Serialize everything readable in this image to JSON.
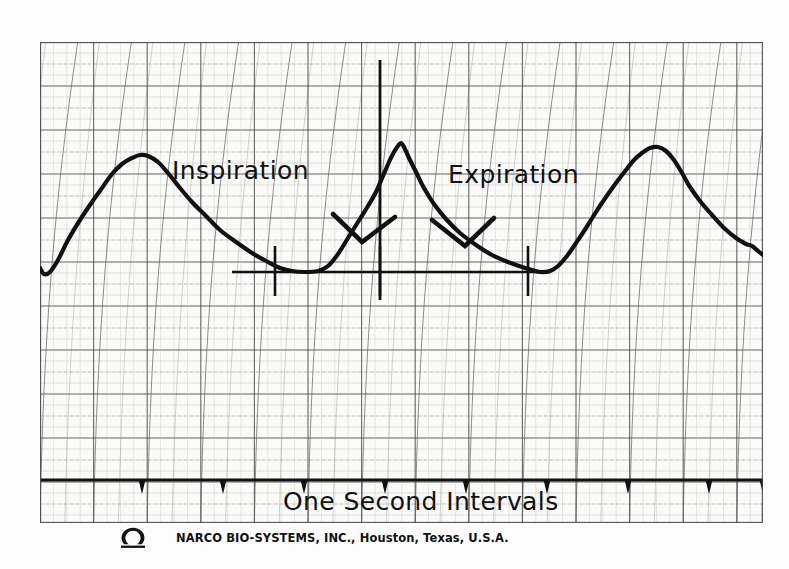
{
  "document": {
    "kind": "chart-recorder-strip",
    "manufacturer_line": "NARCO BIO-SYSTEMS, INC., Houston, Texas, U.S.A.",
    "logo_icon": "omega-logo-icon"
  },
  "annotations": {
    "inspiration_label": "Inspiration",
    "expiration_label": "Expiration",
    "timebase_label": "One Second Intervals"
  },
  "colors": {
    "paper": "#fbfbf9",
    "grid_minor": "#b9b9b9",
    "grid_major": "#4a4a4a",
    "grid_dotted": "#9a9a9a",
    "curved_rulings": "#5a5a5a",
    "trace": "#111111",
    "ink": "#111111",
    "background": "#fdfdfd"
  },
  "chart_data": {
    "type": "line",
    "subtitle": "NARCO BIO-SYSTEMS chart-recorder strip",
    "xlabel": "One Second Intervals",
    "ylabel": "",
    "grid": true,
    "legend": "none",
    "axis_units": {
      "x": "seconds",
      "y": "relative respiratory excursion"
    },
    "xlim": [
      0,
      723
    ],
    "ylim": [
      0,
      481
    ],
    "note": "Coordinates are in paper pixels: x left-to-right = time, y is inverted (smaller y = greater inspiration).",
    "timing_marks_count": 9,
    "timing_mark_x": [
      102,
      183,
      264,
      345,
      426,
      507,
      588,
      669,
      723
    ],
    "timing_baseline_y": 438,
    "measurement_line": {
      "x_start": 192,
      "x_end": 510,
      "y": 230
    },
    "measurement_ticks_x": [
      235,
      340,
      488
    ],
    "series": [
      {
        "name": "Respiratory trace",
        "points": [
          [
            0,
            226
          ],
          [
            4,
            232
          ],
          [
            10,
            230
          ],
          [
            18,
            218
          ],
          [
            28,
            198
          ],
          [
            40,
            178
          ],
          [
            52,
            160
          ],
          [
            62,
            146
          ],
          [
            72,
            132
          ],
          [
            82,
            122
          ],
          [
            92,
            116
          ],
          [
            100,
            113
          ],
          [
            108,
            114
          ],
          [
            118,
            120
          ],
          [
            128,
            131
          ],
          [
            140,
            146
          ],
          [
            152,
            160
          ],
          [
            166,
            174
          ],
          [
            180,
            188
          ],
          [
            196,
            200
          ],
          [
            212,
            211
          ],
          [
            228,
            220
          ],
          [
            240,
            226
          ],
          [
            252,
            229
          ],
          [
            264,
            230
          ],
          [
            278,
            229
          ],
          [
            288,
            224
          ],
          [
            298,
            212
          ],
          [
            308,
            196
          ],
          [
            318,
            180
          ],
          [
            328,
            164
          ],
          [
            336,
            150
          ],
          [
            343,
            134
          ],
          [
            349,
            120
          ],
          [
            354,
            110
          ],
          [
            358,
            104
          ],
          [
            361,
            101
          ],
          [
            364,
            105
          ],
          [
            369,
            116
          ],
          [
            376,
            130
          ],
          [
            384,
            146
          ],
          [
            394,
            162
          ],
          [
            406,
            177
          ],
          [
            420,
            191
          ],
          [
            436,
            203
          ],
          [
            452,
            213
          ],
          [
            468,
            220
          ],
          [
            482,
            225
          ],
          [
            492,
            228
          ],
          [
            500,
            230
          ],
          [
            510,
            229
          ],
          [
            518,
            224
          ],
          [
            527,
            214
          ],
          [
            536,
            201
          ],
          [
            546,
            186
          ],
          [
            556,
            170
          ],
          [
            566,
            155
          ],
          [
            576,
            141
          ],
          [
            586,
            128
          ],
          [
            594,
            118
          ],
          [
            602,
            111
          ],
          [
            610,
            106
          ],
          [
            618,
            105
          ],
          [
            626,
            109
          ],
          [
            634,
            118
          ],
          [
            642,
            131
          ],
          [
            650,
            145
          ],
          [
            660,
            159
          ],
          [
            672,
            173
          ],
          [
            684,
            186
          ],
          [
            696,
            196
          ],
          [
            706,
            202
          ],
          [
            712,
            204
          ],
          [
            718,
            209
          ],
          [
            723,
            213
          ]
        ]
      }
    ],
    "features": [
      {
        "name": "peak-1",
        "type": "inspiratory peak",
        "x": 100,
        "y": 113
      },
      {
        "name": "trough-1",
        "type": "expiratory trough",
        "x": 264,
        "y": 230
      },
      {
        "name": "peak-2",
        "type": "inspiratory peak (sharp)",
        "x": 361,
        "y": 101
      },
      {
        "name": "trough-2",
        "type": "expiratory trough",
        "x": 500,
        "y": 230
      },
      {
        "name": "peak-3",
        "type": "inspiratory peak (rounded)",
        "x": 618,
        "y": 105
      }
    ],
    "leaders": [
      {
        "label": "Inspiration",
        "from": [
          293,
          172
        ],
        "to": [
          322,
          200
        ],
        "tail": [
          355,
          175
        ]
      },
      {
        "label": "Expiration",
        "from": [
          454,
          176
        ],
        "to": [
          425,
          204
        ],
        "tail": [
          392,
          178
        ]
      }
    ]
  },
  "grid_spec": {
    "minor_spacing_px": 13.4,
    "major_every": 4,
    "curved_ruling_count": 28,
    "curved_ruling_bow_px": 26,
    "horizontal_minor_spacing_px": 11.0,
    "horizontal_major_every": 4
  }
}
